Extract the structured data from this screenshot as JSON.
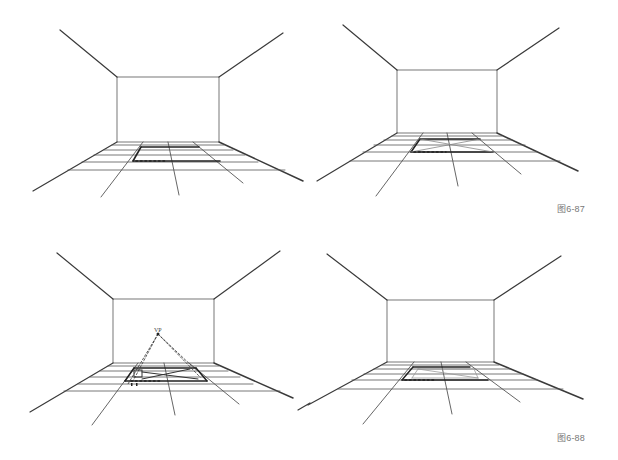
{
  "figures": [
    {
      "id": "fig-6-87",
      "caption": "图6-87",
      "panels": [
        "room-grid-dotted-base",
        "room-grid-diagonals"
      ]
    },
    {
      "id": "fig-6-88",
      "caption": "图6-88",
      "panels": [
        "room-grid-vanishing-point",
        "room-grid-result"
      ]
    }
  ],
  "labels": {
    "vp": "VP"
  },
  "colors": {
    "line": "#3a3a3a",
    "light_line": "#8a8a8a",
    "caption": "#777777"
  }
}
